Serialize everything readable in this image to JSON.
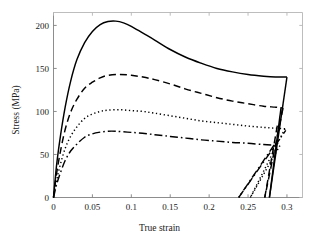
{
  "chart_data": {
    "type": "line",
    "title": "",
    "xlabel": "True strain",
    "ylabel": "Stress (MPa)",
    "xlim": [
      0,
      0.32
    ],
    "ylim": [
      0,
      215
    ],
    "xticks": [
      0,
      0.05,
      0.1,
      0.15,
      0.2,
      0.25,
      0.3
    ],
    "xticklabels": [
      "0",
      "0.05",
      "0.1",
      "0.15",
      "0.2",
      "0.25",
      "0.3"
    ],
    "yticks": [
      0,
      50,
      100,
      150,
      200
    ],
    "yticklabels": [
      "0",
      "50",
      "100",
      "150",
      "200"
    ],
    "grid": false,
    "legend": "none",
    "axes_style": "left-and-bottom-spines",
    "series": [
      {
        "name": "curve-solid",
        "linestyle": "solid",
        "color": "#000000",
        "peak": {
          "x": 0.08,
          "y": 205
        },
        "end_load": {
          "x": 0.3,
          "y": 140
        },
        "unload_to": {
          "x": 0.2775,
          "y": 0
        },
        "reload_to": {
          "x": 0.2925,
          "y": 105
        },
        "x": [
          0,
          0.004,
          0.009,
          0.015,
          0.022,
          0.03,
          0.04,
          0.05,
          0.06,
          0.07,
          0.08,
          0.09,
          0.1,
          0.115,
          0.13,
          0.15,
          0.17,
          0.19,
          0.21,
          0.23,
          0.25,
          0.27,
          0.285,
          0.3
        ],
        "y": [
          0,
          38,
          72,
          105,
          135,
          160,
          180,
          193,
          201,
          204.5,
          205,
          203,
          199,
          191,
          183,
          172,
          163,
          156,
          150,
          146,
          143,
          141,
          140,
          140
        ]
      },
      {
        "name": "curve-dashed",
        "linestyle": "dashed",
        "color": "#000000",
        "peak": {
          "x": 0.085,
          "y": 143
        },
        "end_load": {
          "x": 0.295,
          "y": 104
        },
        "unload_to": {
          "x": 0.2715,
          "y": 0
        },
        "reload_to": {
          "x": 0.2885,
          "y": 88
        },
        "x": [
          0,
          0.004,
          0.009,
          0.015,
          0.022,
          0.03,
          0.04,
          0.05,
          0.06,
          0.07,
          0.085,
          0.1,
          0.115,
          0.13,
          0.15,
          0.17,
          0.19,
          0.21,
          0.23,
          0.25,
          0.27,
          0.285,
          0.295
        ],
        "y": [
          0,
          28,
          54,
          79,
          99,
          114,
          127,
          134,
          139,
          142,
          143,
          142,
          140,
          137,
          132,
          126,
          121,
          116,
          112,
          109,
          106,
          105,
          104
        ]
      },
      {
        "name": "curve-dotted",
        "linestyle": "dotted",
        "color": "#000000",
        "peak": {
          "x": 0.085,
          "y": 102
        },
        "end_load": {
          "x": 0.2975,
          "y": 80
        },
        "unload_to": {
          "x": 0.253,
          "y": 0
        },
        "reload_to": {
          "x": 0.292,
          "y": 62
        },
        "x": [
          0,
          0.004,
          0.009,
          0.015,
          0.022,
          0.03,
          0.04,
          0.05,
          0.06,
          0.07,
          0.085,
          0.1,
          0.115,
          0.13,
          0.15,
          0.17,
          0.19,
          0.21,
          0.23,
          0.25,
          0.27,
          0.285,
          0.2975
        ],
        "y": [
          0,
          20,
          39,
          57,
          71,
          82,
          92,
          97,
          100,
          101.5,
          102,
          101,
          100,
          98,
          95,
          92,
          89,
          87,
          85,
          83,
          81.5,
          80.5,
          80
        ]
      },
      {
        "name": "curve-dashdot",
        "linestyle": "dashdot",
        "color": "#000000",
        "peak": {
          "x": 0.08,
          "y": 77
        },
        "end_load": {
          "x": 0.2835,
          "y": 61
        },
        "unload_to": {
          "x": 0.238,
          "y": 0
        },
        "reload_to": {
          "x": 0.2985,
          "y": 78
        },
        "x": [
          0,
          0.004,
          0.009,
          0.015,
          0.022,
          0.03,
          0.04,
          0.05,
          0.06,
          0.07,
          0.08,
          0.095,
          0.11,
          0.13,
          0.15,
          0.17,
          0.19,
          0.21,
          0.23,
          0.25,
          0.27,
          0.2835
        ],
        "y": [
          0,
          15,
          29,
          43,
          54,
          62,
          70,
          74,
          76,
          77,
          77,
          76,
          75,
          73,
          71,
          69,
          67,
          65.5,
          64,
          63,
          61.5,
          61
        ]
      }
    ]
  }
}
